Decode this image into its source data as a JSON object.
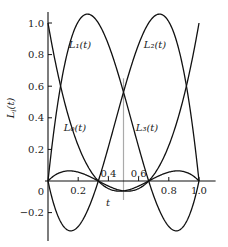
{
  "chart_data": {
    "type": "line",
    "title": "",
    "xlabel": "t",
    "ylabel": "L_i(t)",
    "xlim": [
      0,
      1.0
    ],
    "ylim": [
      -0.35,
      1.05
    ],
    "grid": false,
    "legend": "inline labels on curves",
    "x_ticks": [
      0.2,
      0.4,
      0.6,
      0.8,
      1.0
    ],
    "x_tick_labels": [
      "0.2",
      "0.4",
      "0.6",
      "0.8",
      "1.0"
    ],
    "origin_label": "0",
    "y_ticks": [
      -0.2,
      0.2,
      0.4,
      0.6,
      0.8,
      1.0
    ],
    "y_tick_labels": [
      "-0.2",
      "0.2",
      "0.4",
      "0.6",
      "0.8",
      "1.0"
    ],
    "nodes": [
      0,
      0.3333,
      0.6667,
      1.0
    ],
    "x": [
      0,
      0.1,
      0.2,
      0.3,
      0.3333,
      0.4,
      0.5,
      0.6,
      0.6667,
      0.7,
      0.8,
      0.9,
      1.0
    ],
    "series": [
      {
        "name": "L_0(t)",
        "label": "L₀(t)",
        "values": [
          1.0,
          0.504,
          0.176,
          0.014,
          0.0,
          -0.036,
          -0.063,
          -0.048,
          0.0,
          0.024,
          0.048,
          0.031,
          0.0
        ]
      },
      {
        "name": "L_1(t)",
        "label": "L₁(t)",
        "values": [
          0.0,
          0.693,
          1.008,
          0.851,
          0.75,
          0.324,
          -0.187,
          -0.324,
          -0.25,
          -0.227,
          -0.144,
          -0.027,
          0.0
        ]
      },
      {
        "name": "L_2(t)",
        "label": "L₂(t)",
        "values": [
          0.0,
          -0.027,
          -0.144,
          -0.227,
          -0.25,
          0.324,
          0.563,
          0.324,
          0.0,
          0.851,
          1.008,
          0.693,
          0.0
        ]
      },
      {
        "name": "L_3(t)",
        "label": "L₃(t)",
        "values": [
          0.0,
          0.031,
          0.048,
          0.024,
          0.0,
          -0.048,
          -0.063,
          -0.036,
          0.0,
          0.014,
          0.176,
          0.504,
          1.0
        ]
      }
    ],
    "reference_line": {
      "x": 0.5,
      "color": "#aaaaaa",
      "from_y": -0.12,
      "to_y": 0.65
    },
    "line_color": "#111111"
  },
  "labels": {
    "origin": "0",
    "t_axis": "t",
    "y_axis": "L",
    "y_axis_sub": "i",
    "y_axis_tail": "(t)"
  }
}
